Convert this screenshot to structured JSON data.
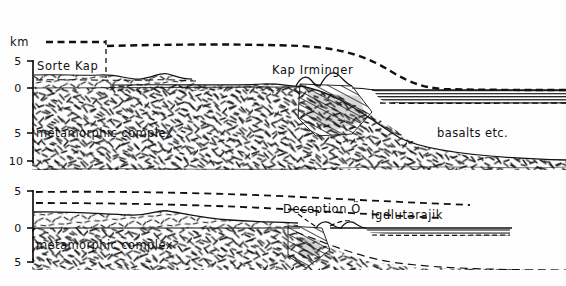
{
  "figure": {
    "type": "geological-cross-section",
    "unit_label": "km",
    "panels": [
      {
        "id": "upper",
        "axis": {
          "ticks": [
            "5",
            "0",
            "5",
            "10"
          ],
          "tick_values": [
            5,
            0,
            -5,
            -10
          ],
          "unit": "km"
        },
        "labels": [
          {
            "id": "sorte-kap",
            "text": "Sorte Kap"
          },
          {
            "id": "kap-irminger",
            "text": "Kap Irminger"
          },
          {
            "id": "metamorphic-complex",
            "text": "metamorphic complex"
          },
          {
            "id": "basalts",
            "text": "basalts etc."
          }
        ]
      },
      {
        "id": "lower",
        "axis": {
          "ticks": [
            "5",
            "0",
            "5"
          ],
          "tick_values": [
            5,
            0,
            -5
          ],
          "unit": "km"
        },
        "labels": [
          {
            "id": "deception-o",
            "text": "Deception Ö"
          },
          {
            "id": "igdlutarajik",
            "text": "Igdlutarajik"
          },
          {
            "id": "metamorphic-complex",
            "text": "metamorphic complex"
          }
        ]
      }
    ],
    "colors": {
      "ink": "#111111",
      "paper": "#fefefe",
      "hatch": "#1b1b1b"
    }
  }
}
